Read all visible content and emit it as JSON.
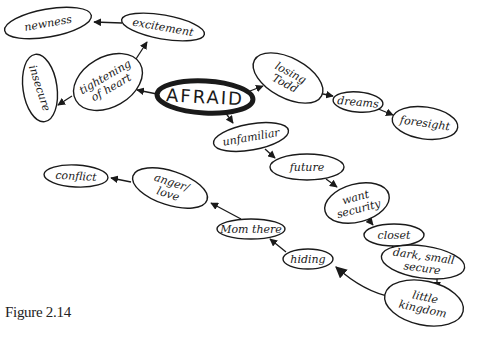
{
  "diagram": {
    "type": "mind-map",
    "caption": "Figure 2.14",
    "central_node": "AFRAID",
    "colors": {
      "ink": "#1a1a1a",
      "background": "#ffffff"
    },
    "nodes": [
      {
        "id": "afraid",
        "label": "AFRAID",
        "lines": [
          "AFRAID"
        ],
        "cx": 205,
        "cy": 97,
        "rx": 48,
        "ry": 16,
        "rot": 3,
        "central": true
      },
      {
        "id": "tightening",
        "label": "tightening of heart",
        "lines": [
          "tightening",
          "of heart"
        ],
        "cx": 108,
        "cy": 82,
        "rx": 37,
        "ry": 25,
        "rot": -30
      },
      {
        "id": "excitement",
        "label": "excitement",
        "lines": [
          "excitement"
        ],
        "cx": 163,
        "cy": 27,
        "rx": 42,
        "ry": 12,
        "rot": 10
      },
      {
        "id": "newness",
        "label": "newness",
        "lines": [
          "newness"
        ],
        "cx": 48,
        "cy": 23,
        "rx": 44,
        "ry": 14,
        "rot": -10
      },
      {
        "id": "insecure",
        "label": "insecure",
        "lines": [
          "insecure"
        ],
        "cx": 40,
        "cy": 88,
        "rx": 17,
        "ry": 34,
        "rot": -8,
        "vertical": true
      },
      {
        "id": "losing-todd",
        "label": "losing Todd",
        "lines": [
          "losing",
          "Todd"
        ],
        "cx": 288,
        "cy": 78,
        "rx": 38,
        "ry": 20,
        "rot": 28
      },
      {
        "id": "dreams",
        "label": "dreams",
        "lines": [
          "dreams"
        ],
        "cx": 358,
        "cy": 102,
        "rx": 25,
        "ry": 10,
        "rot": 5
      },
      {
        "id": "foresight",
        "label": "foresight",
        "lines": [
          "foresight"
        ],
        "cx": 425,
        "cy": 123,
        "rx": 33,
        "ry": 16,
        "rot": 8
      },
      {
        "id": "unfamiliar",
        "label": "unfamiliar",
        "lines": [
          "unfamiliar"
        ],
        "cx": 251,
        "cy": 137,
        "rx": 38,
        "ry": 13,
        "rot": -10
      },
      {
        "id": "future",
        "label": "future",
        "lines": [
          "future"
        ],
        "cx": 307,
        "cy": 167,
        "rx": 37,
        "ry": 13,
        "rot": 0
      },
      {
        "id": "want-security",
        "label": "want security",
        "lines": [
          "want",
          "security"
        ],
        "cx": 357,
        "cy": 203,
        "rx": 33,
        "ry": 19,
        "rot": -15
      },
      {
        "id": "closet",
        "label": "closet",
        "lines": [
          "closet"
        ],
        "cx": 394,
        "cy": 235,
        "rx": 30,
        "ry": 11,
        "rot": 0
      },
      {
        "id": "dark-small-secure",
        "label": "dark, small secure",
        "lines": [
          "dark, small",
          "secure"
        ],
        "cx": 423,
        "cy": 262,
        "rx": 42,
        "ry": 16,
        "rot": 8
      },
      {
        "id": "little-kingdom",
        "label": "little kingdom",
        "lines": [
          "little",
          "kingdom"
        ],
        "cx": 424,
        "cy": 303,
        "rx": 40,
        "ry": 22,
        "rot": 12
      },
      {
        "id": "hiding",
        "label": "hiding",
        "lines": [
          "hiding"
        ],
        "cx": 308,
        "cy": 259,
        "rx": 25,
        "ry": 10,
        "rot": 0
      },
      {
        "id": "mom-there",
        "label": "Mom there",
        "lines": [
          "Mom there"
        ],
        "cx": 251,
        "cy": 229,
        "rx": 34,
        "ry": 10,
        "rot": 0
      },
      {
        "id": "anger-love",
        "label": "anger/ love",
        "lines": [
          "anger/",
          "love"
        ],
        "cx": 170,
        "cy": 188,
        "rx": 39,
        "ry": 17,
        "rot": 18
      },
      {
        "id": "conflict",
        "label": "conflict",
        "lines": [
          "conflict"
        ],
        "cx": 76,
        "cy": 176,
        "rx": 32,
        "ry": 11,
        "rot": 3
      }
    ],
    "edges": [
      {
        "from": "afraid",
        "to": "tightening",
        "x1": 157,
        "y1": 94,
        "x2": 137,
        "y2": 90
      },
      {
        "from": "tightening",
        "to": "excitement",
        "x1": 134,
        "y1": 62,
        "x2": 147,
        "y2": 42
      },
      {
        "from": "excitement",
        "to": "newness",
        "x1": 122,
        "y1": 23,
        "x2": 94,
        "y2": 22
      },
      {
        "from": "tightening",
        "to": "insecure",
        "x1": 72,
        "y1": 96,
        "x2": 58,
        "y2": 105
      },
      {
        "from": "afraid",
        "to": "losing-todd",
        "x1": 250,
        "y1": 91,
        "x2": 263,
        "y2": 86
      },
      {
        "from": "losing-todd",
        "to": "dreams",
        "x1": 318,
        "y1": 93,
        "x2": 333,
        "y2": 96
      },
      {
        "from": "dreams",
        "to": "foresight",
        "x1": 376,
        "y1": 108,
        "x2": 393,
        "y2": 115
      },
      {
        "from": "afraid",
        "to": "unfamiliar",
        "x1": 225,
        "y1": 112,
        "x2": 233,
        "y2": 123
      },
      {
        "from": "unfamiliar",
        "to": "future",
        "x1": 265,
        "y1": 149,
        "x2": 275,
        "y2": 158
      },
      {
        "from": "future",
        "to": "want-security",
        "x1": 326,
        "y1": 179,
        "x2": 337,
        "y2": 187
      },
      {
        "from": "want-security",
        "to": "closet",
        "x1": 368,
        "y1": 219,
        "x2": 373,
        "y2": 225
      },
      {
        "from": "closet",
        "to": "dark-small-secure",
        "x1": 392,
        "y1": 246,
        "x2": 399,
        "y2": 252
      },
      {
        "from": "dark-small-secure",
        "to": "little-kingdom",
        "x1": 437,
        "y1": 278,
        "x2": 437,
        "y2": 289
      },
      {
        "from": "little-kingdom",
        "to": "hiding",
        "x1": 392,
        "y1": 297,
        "x2": 336,
        "y2": 267,
        "curved": true
      },
      {
        "from": "hiding",
        "to": "mom-there",
        "x1": 286,
        "y1": 252,
        "x2": 270,
        "y2": 239
      },
      {
        "from": "mom-there",
        "to": "anger-love",
        "x1": 241,
        "y1": 219,
        "x2": 211,
        "y2": 203
      },
      {
        "from": "anger-love",
        "to": "conflict",
        "x1": 131,
        "y1": 182,
        "x2": 111,
        "y2": 178
      }
    ]
  }
}
